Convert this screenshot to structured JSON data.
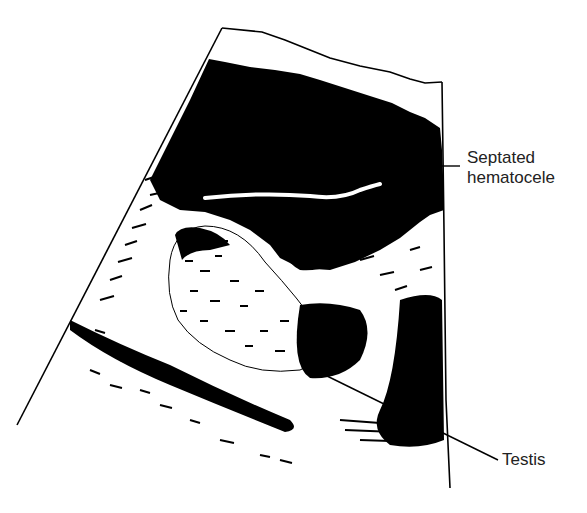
{
  "figure": {
    "type": "ultrasound illustration",
    "colors": {
      "ink": "#000000",
      "background": "#ffffff",
      "label_text": "#222222"
    }
  },
  "labels": {
    "hematocele": {
      "line1": "Septated",
      "line2": "hematocele"
    },
    "testis": {
      "text": "Testis"
    }
  }
}
